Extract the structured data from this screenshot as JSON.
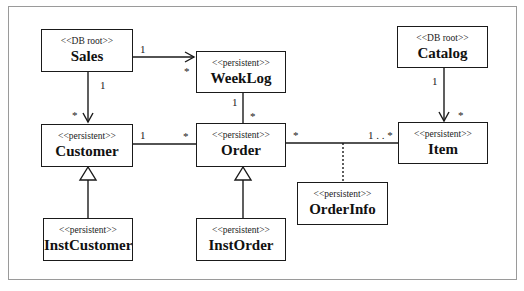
{
  "diagram": {
    "type": "UML class diagram",
    "classes": {
      "sales": {
        "stereotype": "<<DB root>>",
        "name": "Sales"
      },
      "weeklog": {
        "stereotype": "<<persistent>>",
        "name": "WeekLog"
      },
      "catalog": {
        "stereotype": "<<DB root>>",
        "name": "Catalog"
      },
      "customer": {
        "stereotype": "<<persistent>>",
        "name": "Customer"
      },
      "order": {
        "stereotype": "<<persistent>>",
        "name": "Order"
      },
      "item": {
        "stereotype": "<<persistent>>",
        "name": "Item"
      },
      "orderinfo": {
        "stereotype": "<<persistent>>",
        "name": "OrderInfo"
      },
      "instcustomer": {
        "stereotype": "<<persistent>>",
        "name": "InstCustomer"
      },
      "instorder": {
        "stereotype": "<<persistent>>",
        "name": "InstOrder"
      }
    },
    "multiplicities": {
      "sales_weeklog_src": "1",
      "sales_weeklog_dst": "*",
      "sales_customer_src": "1",
      "sales_customer_dst": "*",
      "weeklog_order_src": "1",
      "weeklog_order_dst": "*",
      "customer_order_src": "1",
      "customer_order_dst": "*",
      "order_item_src": "*",
      "order_item_dst": "1 . . *",
      "catalog_item_src": "1",
      "catalog_item_dst": "*"
    },
    "relationships": [
      {
        "from": "Sales",
        "to": "WeekLog",
        "kind": "directed association",
        "from_mult": "1",
        "to_mult": "*"
      },
      {
        "from": "Sales",
        "to": "Customer",
        "kind": "directed association",
        "from_mult": "1",
        "to_mult": "*"
      },
      {
        "from": "WeekLog",
        "to": "Order",
        "kind": "association",
        "from_mult": "1",
        "to_mult": "*"
      },
      {
        "from": "Customer",
        "to": "Order",
        "kind": "association",
        "from_mult": "1",
        "to_mult": "*"
      },
      {
        "from": "Order",
        "to": "Item",
        "kind": "association",
        "from_mult": "*",
        "to_mult": "1..*",
        "association_class": "OrderInfo"
      },
      {
        "from": "Catalog",
        "to": "Item",
        "kind": "directed association",
        "from_mult": "1",
        "to_mult": "*"
      },
      {
        "from": "InstCustomer",
        "to": "Customer",
        "kind": "generalization"
      },
      {
        "from": "InstOrder",
        "to": "Order",
        "kind": "generalization"
      }
    ]
  }
}
